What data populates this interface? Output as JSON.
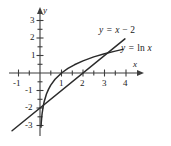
{
  "figure": {
    "title": "",
    "axes": {
      "x_axis_label": "x",
      "y_axis_label": "y",
      "x_ticks": [
        "-1",
        "1",
        "2",
        "3",
        "4"
      ],
      "y_ticks": [
        "3",
        "2",
        "1",
        "-1",
        "-2",
        "-3"
      ]
    },
    "curve_labels": {
      "line": "y = x − 2",
      "line_lhs": "y =",
      "line_rhs_var": "x",
      "line_rhs_rest": "− 2",
      "log": "y = ln x",
      "log_lhs": "y =",
      "log_rhs_fn": "ln",
      "log_rhs_var": "x"
    },
    "colors": {
      "curve": "#2b2b2b",
      "axis": "#3d3d3d",
      "background": "#ffffff"
    }
  },
  "chart_data": {
    "type": "line",
    "title": "",
    "xlabel": "x",
    "ylabel": "y",
    "xlim": [
      -1.4,
      4.7
    ],
    "ylim": [
      -3.5,
      3.4
    ],
    "grid": false,
    "legend": "inline-annotations",
    "x_ticks": [
      -1,
      1,
      2,
      3,
      4
    ],
    "y_ticks": [
      3,
      2,
      1,
      -1,
      -2,
      -3
    ],
    "series": [
      {
        "name": "y = ln x",
        "equation": "y = ln(x)",
        "x": [
          0.045,
          0.06,
          0.08,
          0.1,
          0.15,
          0.2,
          0.3,
          0.4,
          0.5,
          0.7,
          1.0,
          1.3,
          1.6,
          2.0,
          2.5,
          3.0,
          3.5,
          3.85
        ],
        "y": [
          -3.1,
          -2.81,
          -2.53,
          -2.3,
          -1.9,
          -1.61,
          -1.2,
          -0.92,
          -0.69,
          -0.36,
          0.0,
          0.26,
          0.47,
          0.69,
          0.92,
          1.1,
          1.25,
          1.35
        ]
      },
      {
        "name": "y = x - 2",
        "equation": "y = x - 2",
        "x": [
          -1.3,
          0,
          1,
          2,
          3,
          3.95
        ],
        "y": [
          -3.3,
          -2.0,
          -1.0,
          0.0,
          1.0,
          1.95
        ]
      }
    ],
    "annotations": [
      {
        "text": "y = x − 2",
        "x": 2.85,
        "y": 2.1
      },
      {
        "text": "y = ln x",
        "x": 3.85,
        "y": 1.2
      }
    ],
    "intersections": [
      {
        "x": 3.15,
        "y": 1.15
      }
    ]
  }
}
